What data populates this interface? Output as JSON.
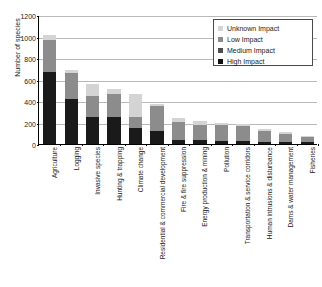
{
  "chart_data": {
    "type": "bar",
    "subtype": "stacked-bar",
    "title": "",
    "xlabel": "",
    "ylabel": "Number of species",
    "ylim": [
      0,
      1200
    ],
    "yticks": [
      0,
      200,
      400,
      600,
      800,
      1000,
      1200
    ],
    "grid": true,
    "legend_position": "top-right",
    "categories": [
      "Agriculture",
      "Logging",
      "Invasive species",
      "Hunting & trapping",
      "Climate change",
      "Residential & commercial development",
      "Fire & fire suppression",
      "Energy production & mining",
      "Pollution",
      "Transportation & service corridors",
      "Human intrusions & disturbance",
      "Dams & water management",
      "Fisheries"
    ],
    "series": [
      {
        "name": "High Impact",
        "color": "#1a1a1a",
        "values": [
          670,
          415,
          250,
          255,
          145,
          118,
          40,
          35,
          28,
          30,
          22,
          20,
          18
        ]
      },
      {
        "name": "Medium Impact",
        "color": "#4d4d4d",
        "values": [
          0,
          0,
          0,
          0,
          0,
          0,
          0,
          0,
          0,
          0,
          0,
          0,
          0
        ]
      },
      {
        "name": "Low Impact",
        "color": "#8c8c8c",
        "values": [
          300,
          248,
          197,
          208,
          108,
          235,
          162,
          140,
          150,
          140,
          98,
          72,
          45
        ]
      },
      {
        "name": "Unknown Impact",
        "color": "#d4d4d4",
        "values": [
          45,
          27,
          110,
          50,
          215,
          22,
          38,
          40,
          22,
          18,
          20,
          20,
          10
        ]
      }
    ],
    "totals": [
      1015,
      690,
      557,
      513,
      468,
      375,
      240,
      215,
      200,
      188,
      140,
      112,
      73
    ],
    "bar_count": 13
  },
  "legend": {
    "items": [
      {
        "label": "Unknown Impact",
        "color": "#d4d4d4"
      },
      {
        "label": "Low Impact",
        "color": "#8c8c8c"
      },
      {
        "label": "Medium Impact",
        "color": "#4d4d4d"
      },
      {
        "label": "High Impact",
        "color": "#111111"
      }
    ]
  },
  "axes": {
    "y_title": "Number of species",
    "y_tick_labels": [
      "0",
      "200",
      "400",
      "600",
      "800",
      "1000",
      "1200"
    ]
  }
}
